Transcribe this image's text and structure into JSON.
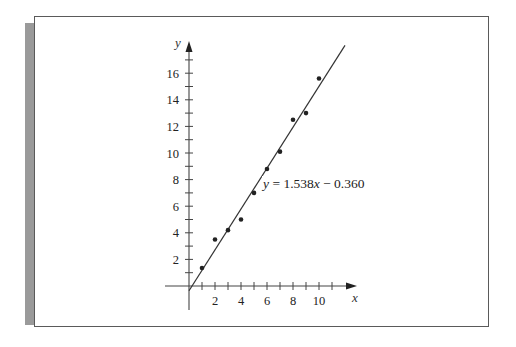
{
  "chart_data": {
    "type": "scatter",
    "title": "",
    "xlabel": "x",
    "ylabel": "y",
    "xlim": [
      -2,
      13
    ],
    "ylim": [
      -2,
      18
    ],
    "grid": false,
    "legend": null,
    "x_ticks": [
      1,
      2,
      3,
      4,
      5,
      6,
      7,
      8,
      9,
      10,
      11
    ],
    "x_tick_labels": [
      "2",
      "4",
      "6",
      "8",
      "10"
    ],
    "x_tick_label_values": [
      2,
      4,
      6,
      8,
      10
    ],
    "y_ticks": [
      1,
      2,
      3,
      4,
      5,
      6,
      7,
      8,
      9,
      10,
      11,
      12,
      13,
      14,
      15,
      16,
      17
    ],
    "y_tick_labels": [
      "2",
      "4",
      "6",
      "8",
      "10",
      "12",
      "14",
      "16"
    ],
    "y_tick_label_values": [
      2,
      4,
      6,
      8,
      10,
      12,
      14,
      16
    ],
    "series": [
      {
        "name": "data points",
        "type": "scatter",
        "x": [
          1,
          2,
          3,
          4,
          5,
          6,
          7,
          8,
          9,
          10
        ],
        "y": [
          1.35,
          3.5,
          4.2,
          5.0,
          7.0,
          8.8,
          10.1,
          12.5,
          13.0,
          15.6
        ]
      },
      {
        "name": "regression line",
        "type": "line",
        "slope": 1.538,
        "intercept": -0.36,
        "x_range": [
          0,
          12.0
        ]
      }
    ],
    "annotations": [
      {
        "text": "y = 1.538x − 0.360",
        "x": 5.7,
        "y": 7.6
      }
    ]
  },
  "equation": {
    "y_var": "y",
    "eq_sign": " = ",
    "coef": "1.538",
    "x_var": "x",
    "rest": " − 0.360"
  },
  "colors": {
    "ink": "#222222",
    "axis": "#444444",
    "frame": "#5a5a5a",
    "side_bar": "#9a9a9a"
  }
}
